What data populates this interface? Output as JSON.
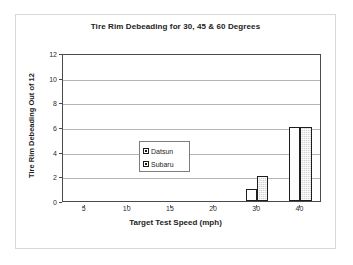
{
  "figure": {
    "background_color": "#ffffff",
    "frame_color": "#d8d8d8",
    "axis_color": "#4a4a4a",
    "grid_color": "#b5b5b5"
  },
  "chart_data": {
    "type": "bar",
    "title": "Tire Rim Debeading for 30, 45 & 60 Degrees",
    "xlabel": "Target Test Speed (mph)",
    "ylabel": "Tire Rim Debeading Out of 12",
    "categories": [
      "5",
      "10",
      "15",
      "20",
      "30",
      "40"
    ],
    "series": [
      {
        "name": "Datsun",
        "values": [
          0,
          0,
          0,
          0,
          1,
          6
        ],
        "color": "#fdfdfd",
        "edge_color": "#1e1e1e"
      },
      {
        "name": "Subaru",
        "values": [
          0,
          0,
          0,
          0,
          2,
          6
        ],
        "color": "#d2d2d2",
        "edge_color": "#1e1e1e"
      }
    ],
    "ylim": [
      0,
      12
    ],
    "yticks": [
      0,
      2,
      4,
      6,
      8,
      10,
      12
    ],
    "ytick_labels": [
      "0",
      "2",
      "4",
      "6",
      "8",
      "10",
      "12"
    ],
    "xtick_labels": [
      "5",
      "10",
      "15",
      "20",
      "30",
      "40"
    ],
    "grid": true,
    "grid_axis": "y",
    "legend_position": "upper left",
    "legend_entries": [
      "Datsun",
      "Subaru"
    ]
  }
}
